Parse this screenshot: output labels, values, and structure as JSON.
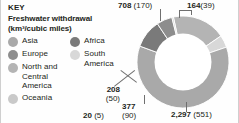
{
  "key": {
    "heading": "KEY",
    "subtitle_line1": "Freshwater withdrawal",
    "subtitle_line2": "(km³/cubic miles)"
  },
  "legend": {
    "left_column": [
      {
        "label": "Asia",
        "color": "#a9a9a9",
        "swatch_name": "swatch-asia"
      },
      {
        "label": "Europe",
        "color": "#8d8d8d",
        "swatch_name": "swatch-europe"
      },
      {
        "label": "North and Central America",
        "color": "#b4b4b4",
        "swatch_name": "swatch-north-and-central-america"
      },
      {
        "label": "Oceania",
        "color": "#c9c9c9",
        "swatch_name": "swatch-oceania"
      }
    ],
    "right_column": [
      {
        "label": "Africa",
        "color": "#7a7a7a",
        "swatch_name": "swatch-africa"
      },
      {
        "label": "South America",
        "color": "#d8d8d8",
        "swatch_name": "swatch-south-america"
      }
    ]
  },
  "labels": {
    "north_america": {
      "value": "708",
      "paren": "(170)"
    },
    "south_america": {
      "value": "164",
      "paren": "(39)"
    },
    "asia": {
      "value": "2,297",
      "paren": "(551)"
    },
    "africa": {
      "value": "377",
      "paren": "(90)"
    },
    "europe": {
      "value": "208",
      "paren": "(50)"
    },
    "oceania": {
      "value": "20",
      "paren": "(5)"
    }
  },
  "chart_data": {
    "type": "pie",
    "variant": "donut",
    "title": "Freshwater withdrawal (km³/cubic miles)",
    "unit_primary": "km³",
    "unit_secondary": "cubic miles",
    "legend_position": "left",
    "total_km3": 3774,
    "categories": [
      "North and Central America",
      "South America",
      "Asia",
      "Africa",
      "Europe",
      "Oceania"
    ],
    "values": [
      708,
      164,
      2297,
      377,
      208,
      20
    ],
    "values_cubic_miles": [
      170,
      39,
      551,
      90,
      50,
      5
    ],
    "colors": [
      "#b4b4b4",
      "#d8d8d8",
      "#a9a9a9",
      "#7a7a7a",
      "#8d8d8d",
      "#c9c9c9"
    ],
    "labels": [
      "708 (170)",
      "164 (39)",
      "2,297 (551)",
      "377 (90)",
      "208 (50)",
      "20 (5)"
    ],
    "slices": [
      {
        "name": "North and Central America",
        "km3": 708,
        "cubic_miles": 170,
        "color": "#b4b4b4",
        "start_angle": 348,
        "sweep": 67.5
      },
      {
        "name": "South America",
        "km3": 164,
        "cubic_miles": 39,
        "color": "#d8d8d8",
        "start_angle": 55.5,
        "sweep": 15.6
      },
      {
        "name": "Asia",
        "km3": 2297,
        "cubic_miles": 551,
        "color": "#a9a9a9",
        "start_angle": 71.1,
        "sweep": 219.1
      },
      {
        "name": "Africa",
        "km3": 377,
        "cubic_miles": 90,
        "color": "#7a7a7a",
        "start_angle": 290.2,
        "sweep": 36.0
      },
      {
        "name": "Europe",
        "km3": 208,
        "cubic_miles": 50,
        "color": "#8d8d8d",
        "start_angle": 326.2,
        "sweep": 19.8
      },
      {
        "name": "Oceania",
        "km3": 20,
        "cubic_miles": 5,
        "color": "#c9c9c9",
        "start_angle": 346.0,
        "sweep": 1.9
      }
    ]
  }
}
